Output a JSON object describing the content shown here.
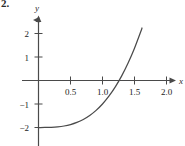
{
  "figure": {
    "problem_number": "2.",
    "background_color": "#ffffff",
    "ink_color": "#4a4a4a",
    "text_color": "#1c1c1c"
  },
  "chart_data": {
    "type": "line",
    "title": "",
    "subtitle": "",
    "xlabel": "x",
    "ylabel": "y",
    "xlim": [
      -0.12,
      2.18
    ],
    "ylim": [
      -2.55,
      2.45
    ],
    "grid": false,
    "legend": null,
    "x_ticks": [
      0.5,
      1.0,
      1.5,
      2.0
    ],
    "x_tick_labels": [
      "0.5",
      "1.0",
      "1.5",
      "2.0"
    ],
    "y_ticks": [
      -2,
      -1,
      1,
      2
    ],
    "y_tick_labels": [
      "−2",
      "−1",
      "1",
      "2"
    ],
    "x_axis_arrow": true,
    "y_axis_arrow": true,
    "series": [
      {
        "name": "curve",
        "color": "#4a4a4a",
        "x": [
          0.0,
          0.1,
          0.2,
          0.3,
          0.4,
          0.5,
          0.6,
          0.7,
          0.8,
          0.9,
          1.0,
          1.1,
          1.2,
          1.3,
          1.4,
          1.5,
          1.6,
          1.7,
          1.8,
          1.9,
          2.0
        ],
        "y": [
          -2.0,
          -1.999,
          -1.992,
          -1.973,
          -1.936,
          -1.875,
          -1.784,
          -1.657,
          -1.488,
          -1.271,
          -1.0,
          -0.669,
          -0.272,
          0.197,
          0.744,
          1.375,
          2.096,
          2.913,
          3.832,
          4.859,
          6.0
        ],
        "x_intercept": 1.4,
        "y_intercept": -2.0
      }
    ],
    "annotations": []
  }
}
